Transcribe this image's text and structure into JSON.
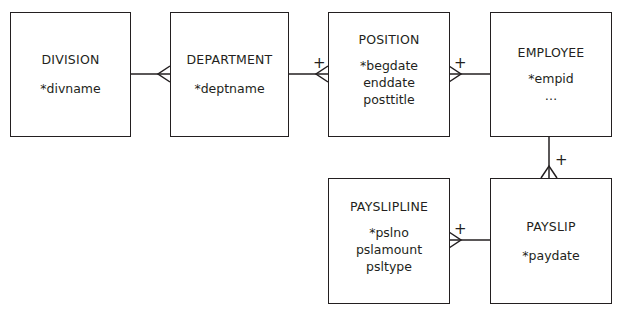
{
  "diagram": {
    "type": "entity-relationship",
    "entities": [
      {
        "id": "division",
        "name": "DIVISION",
        "attributes": [
          "*divname"
        ]
      },
      {
        "id": "department",
        "name": "DEPARTMENT",
        "attributes": [
          "*deptname"
        ]
      },
      {
        "id": "position",
        "name": "POSITION",
        "attributes": [
          "*begdate",
          "enddate",
          "posttitle"
        ]
      },
      {
        "id": "employee",
        "name": "EMPLOYEE",
        "attributes": [
          "*empid",
          "…"
        ]
      },
      {
        "id": "paysliplime",
        "name": "PAYSLIPLINE",
        "attributes": [
          "*pslno",
          "pslamount",
          "psltype"
        ]
      },
      {
        "id": "payslip",
        "name": "PAYSLIP",
        "attributes": [
          "*paydate"
        ]
      }
    ],
    "relationships": [
      {
        "from": "DIVISION",
        "to": "DEPARTMENT",
        "many_end": "DEPARTMENT",
        "marker": ""
      },
      {
        "from": "DEPARTMENT",
        "to": "POSITION",
        "many_end": "POSITION",
        "marker": "+"
      },
      {
        "from": "EMPLOYEE",
        "to": "POSITION",
        "many_end": "POSITION",
        "marker": "+"
      },
      {
        "from": "EMPLOYEE",
        "to": "PAYSLIP",
        "many_end": "PAYSLIP",
        "marker": "+"
      },
      {
        "from": "PAYSLIP",
        "to": "PAYSLIPLINE",
        "many_end": "PAYSLIPLINE",
        "marker": "+"
      }
    ]
  }
}
